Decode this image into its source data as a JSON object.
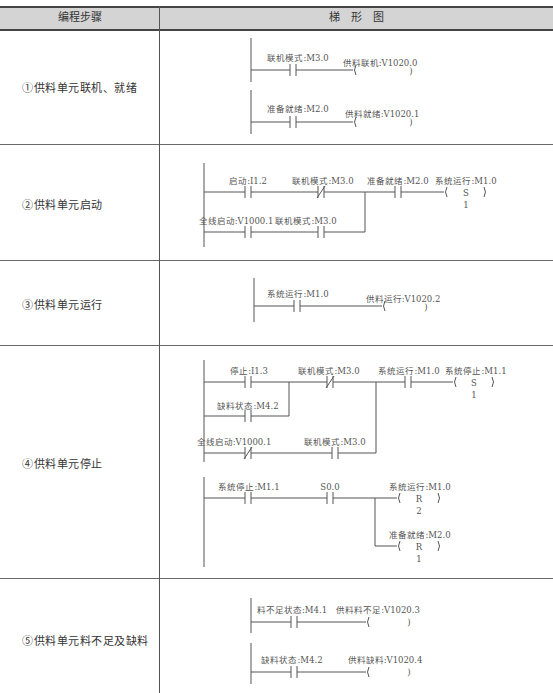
{
  "table": {
    "headers": {
      "step": "编程步骤",
      "diagram": "梯　形　图"
    },
    "rows": [
      {
        "step": "①供料单元联机、就绪"
      },
      {
        "step": "②供料单元启动"
      },
      {
        "step": "③供料单元运行"
      },
      {
        "step": "④供料单元停止"
      },
      {
        "step": "⑤供料单元料不足及缺料"
      }
    ]
  },
  "rungs": {
    "r1a": {
      "contact": "联机模式:M3.0",
      "coil": "供料联机:V1020.0"
    },
    "r1b": {
      "contact": "准备就绪:M2.0",
      "coil": "供料就绪:V1020.1"
    },
    "r2": {
      "c1": "启动:I1.2",
      "c2": "联机模式:M3.0",
      "c3": "准备就绪:M2.0",
      "c4": "全线启动:V1000.1",
      "c5": "联机模式:M3.0",
      "coil": "系统运行:M1.0",
      "coil_op": "S",
      "coil_n": "1"
    },
    "r3": {
      "contact": "系统运行:M1.0",
      "coil": "供料运行:V1020.2"
    },
    "r4a": {
      "c1": "停止:I1.3",
      "c2": "缺料状态:M4.2",
      "c3": "联机模式:M3.0",
      "c4": "全线启动:V1000.1",
      "c5": "联机模式:M3.0",
      "c6": "系统运行:M1.0",
      "coil": "系统停止:M1.1",
      "coil_op": "S",
      "coil_n": "1"
    },
    "r4b": {
      "c1": "系统停止:M1.1",
      "c2": "S0.0",
      "coil1": "系统运行:M1.0",
      "coil1_op": "R",
      "coil1_n": "2",
      "coil2": "准备就绪:M2.0",
      "coil2_op": "R",
      "coil2_n": "1"
    },
    "r5a": {
      "contact": "料不足状态:M4.1",
      "coil": "供料料不足:V1020.3"
    },
    "r5b": {
      "contact": "缺料状态:M4.2",
      "coil": "供料缺料:V1020.4"
    }
  },
  "colors": {
    "header_bg": "#d4d4d4",
    "line": "#555555",
    "text": "#444444"
  }
}
